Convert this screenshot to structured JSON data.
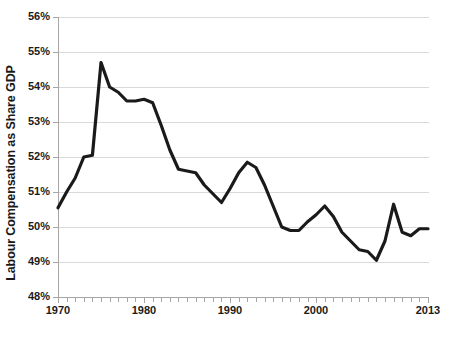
{
  "chart_data": {
    "type": "line",
    "title": "",
    "xlabel": "",
    "ylabel": "Labour Compensation as Share GDP",
    "xlim": [
      1970,
      2013
    ],
    "ylim": [
      48,
      56
    ],
    "grid": true,
    "legend": "none",
    "y_tick_labels": [
      "56%",
      "55%",
      "54%",
      "53%",
      "52%",
      "51%",
      "50%",
      "49%",
      "48%"
    ],
    "y_tick_values": [
      56,
      55,
      54,
      53,
      52,
      51,
      50,
      49,
      48
    ],
    "x_tick_labels": [
      "1970",
      "1980",
      "1990",
      "2000",
      "2013"
    ],
    "x_tick_values": [
      1970,
      1980,
      1990,
      2000,
      2013
    ],
    "x": [
      1970,
      1971,
      1972,
      1973,
      1974,
      1975,
      1976,
      1977,
      1978,
      1979,
      1980,
      1981,
      1982,
      1983,
      1984,
      1985,
      1986,
      1987,
      1988,
      1989,
      1990,
      1991,
      1992,
      1993,
      1994,
      1995,
      1996,
      1997,
      1998,
      1999,
      2000,
      2001,
      2002,
      2003,
      2004,
      2005,
      2006,
      2007,
      2008,
      2009,
      2010,
      2011,
      2012,
      2013
    ],
    "values": [
      50.55,
      51.0,
      51.4,
      52.0,
      52.05,
      54.7,
      54.0,
      53.85,
      53.6,
      53.6,
      53.65,
      53.55,
      52.9,
      52.2,
      51.65,
      51.6,
      51.55,
      51.2,
      50.95,
      50.7,
      51.1,
      51.55,
      51.85,
      51.7,
      51.2,
      50.6,
      50.0,
      49.9,
      49.9,
      50.15,
      50.35,
      50.6,
      50.3,
      49.85,
      49.6,
      49.35,
      49.3,
      49.05,
      49.6,
      50.65,
      49.85,
      49.75,
      49.95,
      49.95
    ],
    "series_color": "#1a1a1a",
    "series_width": 3.2,
    "grid_color": "#d9d9d9",
    "axis_color": "#a6a6a6"
  },
  "axis": {
    "y_title": "Labour Compensation as Share GDP"
  }
}
